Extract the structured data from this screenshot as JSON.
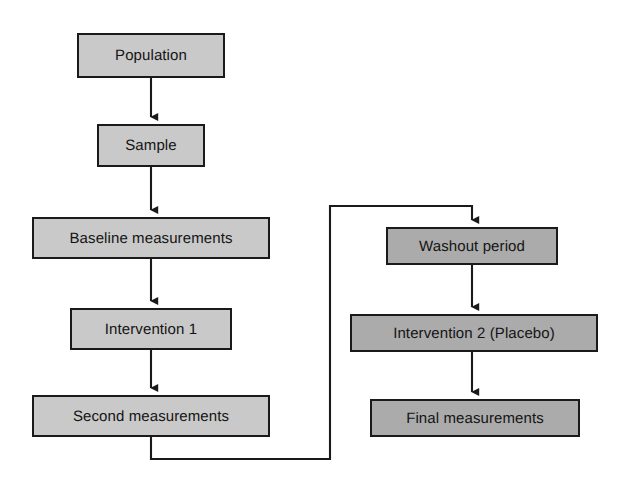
{
  "diagram": {
    "background_color": "#ffffff",
    "line_color": "#1a1a1a",
    "phase_a_color": "#c9c9c9",
    "phase_b_color": "#ababab"
  },
  "nodes": [
    {
      "id": "population",
      "label": "Population",
      "phase": "a",
      "x": 77,
      "y": 33,
      "w": 148,
      "h": 45
    },
    {
      "id": "sample",
      "label": "Sample",
      "phase": "a",
      "x": 97,
      "y": 124,
      "w": 108,
      "h": 43
    },
    {
      "id": "baseline-measurements",
      "label": "Baseline measurements",
      "phase": "a",
      "x": 32,
      "y": 217,
      "w": 238,
      "h": 42
    },
    {
      "id": "intervention-1",
      "label": "Intervention 1",
      "phase": "a",
      "x": 70,
      "y": 308,
      "w": 162,
      "h": 42
    },
    {
      "id": "second-measurements",
      "label": "Second measurements",
      "phase": "a",
      "x": 32,
      "y": 395,
      "w": 238,
      "h": 42
    },
    {
      "id": "washout-period",
      "label": "Washout period",
      "phase": "b",
      "x": 386,
      "y": 227,
      "w": 172,
      "h": 38
    },
    {
      "id": "intervention-2-placebo",
      "label": "Intervention 2 (Placebo)",
      "phase": "b",
      "x": 350,
      "y": 314,
      "w": 248,
      "h": 38
    },
    {
      "id": "final-measurements",
      "label": "Final measurements",
      "phase": "b",
      "x": 370,
      "y": 399,
      "w": 210,
      "h": 38
    }
  ],
  "connectors": [
    {
      "id": "population-to-sample",
      "from": "population",
      "to": "sample",
      "type": "straight-down"
    },
    {
      "id": "sample-to-baseline",
      "from": "sample",
      "to": "baseline-measurements",
      "type": "straight-down"
    },
    {
      "id": "baseline-to-intervention-1",
      "from": "baseline-measurements",
      "to": "intervention-1",
      "type": "straight-down"
    },
    {
      "id": "intervention-1-to-second",
      "from": "intervention-1",
      "to": "second-measurements",
      "type": "straight-down"
    },
    {
      "id": "second-to-washout",
      "from": "second-measurements",
      "to": "washout-period",
      "type": "elbow-crossover"
    },
    {
      "id": "washout-to-intervention-2",
      "from": "washout-period",
      "to": "intervention-2-placebo",
      "type": "straight-down"
    },
    {
      "id": "intervention-2-to-final",
      "from": "intervention-2-placebo",
      "to": "final-measurements",
      "type": "straight-down"
    }
  ]
}
